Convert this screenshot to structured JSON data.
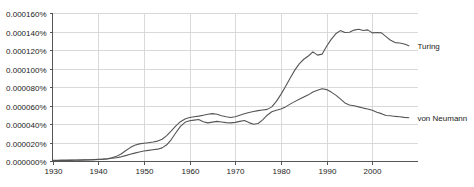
{
  "chart_data": {
    "type": "line",
    "title": "",
    "xlabel": "",
    "ylabel": "",
    "xlim": [
      1930,
      2010
    ],
    "ylim": [
      0,
      0.00016
    ],
    "grid": true,
    "legend_position": "right-inline",
    "x_ticks": [
      1930,
      1940,
      1950,
      1960,
      1970,
      1980,
      1990,
      2000
    ],
    "x_tick_labels": [
      "1930",
      "1940",
      "1950",
      "1960",
      "1970",
      "1980",
      "1990",
      "2000"
    ],
    "y_ticks": [
      0,
      2e-05,
      4e-05,
      6e-05,
      8e-05,
      0.0001,
      0.00012,
      0.00014,
      0.00016
    ],
    "y_tick_labels": [
      "0.000000%",
      "0.000020%",
      "0.000040%",
      "0.000060%",
      "0.000080%",
      "0.000100%",
      "0.000120%",
      "0.000140%",
      "0.000160%"
    ],
    "x": [
      1930,
      1931,
      1932,
      1933,
      1934,
      1935,
      1936,
      1937,
      1938,
      1939,
      1940,
      1941,
      1942,
      1943,
      1944,
      1945,
      1946,
      1947,
      1948,
      1949,
      1950,
      1951,
      1952,
      1953,
      1954,
      1955,
      1956,
      1957,
      1958,
      1959,
      1960,
      1961,
      1962,
      1963,
      1964,
      1965,
      1966,
      1967,
      1968,
      1969,
      1970,
      1971,
      1972,
      1973,
      1974,
      1975,
      1976,
      1977,
      1978,
      1979,
      1980,
      1981,
      1982,
      1983,
      1984,
      1985,
      1986,
      1987,
      1988,
      1989,
      1990,
      1991,
      1992,
      1993,
      1994,
      1995,
      1996,
      1997,
      1998,
      1999,
      2000,
      2001,
      2002,
      2003,
      2004,
      2005,
      2006,
      2007,
      2008
    ],
    "series": [
      {
        "name": "Turing",
        "color": "#555555",
        "label_x": 2009,
        "values": [
          8e-07,
          8e-07,
          9e-07,
          9e-07,
          1e-06,
          1e-06,
          1.1e-06,
          1.2e-06,
          1.3e-06,
          1.5e-06,
          1.8e-06,
          2e-06,
          2.5e-06,
          3.5e-06,
          5e-06,
          7.5e-06,
          1.1e-05,
          1.45e-05,
          1.7e-05,
          1.85e-05,
          1.92e-05,
          1.98e-05,
          2.05e-05,
          2.15e-05,
          2.35e-05,
          2.75e-05,
          3.25e-05,
          3.8e-05,
          4.25e-05,
          4.55e-05,
          4.7e-05,
          4.78e-05,
          4.85e-05,
          4.95e-05,
          5.05e-05,
          5.12e-05,
          5.05e-05,
          4.9e-05,
          4.78e-05,
          4.7e-05,
          4.78e-05,
          4.95e-05,
          5.1e-05,
          5.25e-05,
          5.35e-05,
          5.45e-05,
          5.52e-05,
          5.58e-05,
          5.85e-05,
          6.45e-05,
          7.2e-05,
          8.05e-05,
          8.95e-05,
          9.8e-05,
          0.000105,
          0.00011,
          0.0001135,
          0.000118,
          0.0001145,
          0.0001155,
          0.000124,
          0.0001315,
          0.0001375,
          0.000141,
          0.000139,
          0.0001392,
          0.0001415,
          0.0001425,
          0.000141,
          0.0001418,
          0.0001385,
          0.000139,
          0.0001385,
          0.0001345,
          0.0001305,
          0.000128,
          0.0001275,
          0.0001265,
          0.0001245
        ]
      },
      {
        "name": "von Neumann",
        "color": "#555555",
        "label_x": 2009,
        "values": [
          5e-07,
          5e-07,
          6e-07,
          6e-07,
          7e-07,
          8e-07,
          9e-07,
          1e-06,
          1.1e-06,
          1.3e-06,
          1.6e-06,
          1.9e-06,
          2.3e-06,
          2.9e-06,
          3.6e-06,
          4.5e-06,
          5.8e-06,
          7.2e-06,
          8.5e-06,
          9.8e-06,
          1.08e-05,
          1.15e-05,
          1.22e-05,
          1.28e-05,
          1.42e-05,
          1.75e-05,
          2.32e-05,
          3.05e-05,
          3.75e-05,
          4.18e-05,
          4.35e-05,
          4.42e-05,
          4.48e-05,
          4.25e-05,
          4.12e-05,
          4.2e-05,
          4.28e-05,
          4.22e-05,
          4.15e-05,
          4.12e-05,
          4.18e-05,
          4.28e-05,
          4.38e-05,
          4.15e-05,
          3.98e-05,
          4.05e-05,
          4.45e-05,
          4.95e-05,
          5.32e-05,
          5.48e-05,
          5.62e-05,
          5.85e-05,
          6.15e-05,
          6.42e-05,
          6.68e-05,
          6.92e-05,
          7.15e-05,
          7.45e-05,
          7.65e-05,
          7.82e-05,
          7.72e-05,
          7.45e-05,
          7.12e-05,
          6.72e-05,
          6.28e-05,
          6.05e-05,
          5.98e-05,
          5.85e-05,
          5.72e-05,
          5.62e-05,
          5.48e-05,
          5.28e-05,
          5.12e-05,
          4.92e-05,
          4.9e-05,
          4.82e-05,
          4.78e-05,
          4.72e-05,
          4.68e-05
        ]
      }
    ]
  }
}
